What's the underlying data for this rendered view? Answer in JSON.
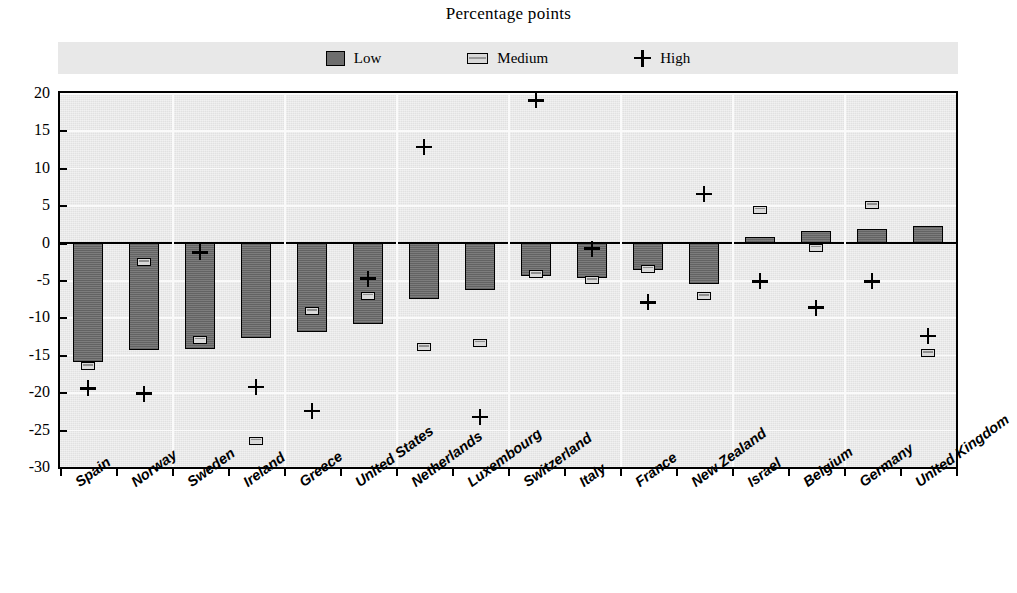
{
  "chart": {
    "title": "Percentage points",
    "legend": [
      {
        "key": "low",
        "label": "Low",
        "marker": "filled-square-dark"
      },
      {
        "key": "medium",
        "label": "Medium",
        "marker": "filled-rect-light"
      },
      {
        "key": "high",
        "label": "High",
        "marker": "plus-sign"
      }
    ],
    "legend_position": "top-center"
  },
  "chart_data": {
    "type": "bar",
    "title": "Percentage points",
    "xlabel": "",
    "ylabel": "",
    "ylim": [
      -30,
      20
    ],
    "yticks": [
      20,
      15,
      10,
      5,
      0,
      -5,
      -10,
      -15,
      -20,
      -25,
      -30
    ],
    "ytick_labels": [
      "20",
      "15",
      "10",
      "5",
      "0",
      "-5",
      "-10",
      "-15",
      "-20",
      "-25",
      "-30"
    ],
    "grid": true,
    "legend": [
      "Low",
      "Medium",
      "High"
    ],
    "categories": [
      "Spain",
      "Norway",
      "Sweden",
      "Ireland",
      "Greece",
      "United States",
      "Netherlands",
      "Luxembourg",
      "Switzerland",
      "Italy",
      "France",
      "New Zealand",
      "Israel",
      "Belgium",
      "Germany",
      "United Kingdom"
    ],
    "series": [
      {
        "name": "Low",
        "render": "bar",
        "values": [
          -16.0,
          -14.3,
          -14.2,
          -12.8,
          -12.0,
          -10.9,
          -7.6,
          -6.4,
          -4.5,
          -4.7,
          -3.7,
          -5.6,
          0.8,
          1.5,
          1.8,
          2.2
        ]
      },
      {
        "name": "Medium",
        "render": "marker-rect",
        "values": [
          -16.5,
          -2.6,
          -13.0,
          -26.5,
          -9.2,
          -7.1,
          -14.0,
          -13.4,
          -4.2,
          -5.0,
          -3.5,
          -7.2,
          4.4,
          -0.7,
          5.0,
          -14.8
        ]
      },
      {
        "name": "High",
        "render": "marker-plus",
        "values": [
          -19.5,
          -20.2,
          -1.3,
          -19.3,
          -22.5,
          -4.8,
          12.8,
          -23.3,
          19.0,
          -0.8,
          -8.0,
          6.5,
          -5.2,
          -8.7,
          -5.2,
          -12.5
        ]
      }
    ]
  },
  "colors": {
    "bar_fill": "#6e6e6e",
    "bar_edge": "#000000",
    "medium_fill": "#d9d9d9",
    "plot_background": "#ebebeb",
    "legend_background": "#e8e8e8",
    "axis": "#000000",
    "gridline": "#fafafa"
  }
}
